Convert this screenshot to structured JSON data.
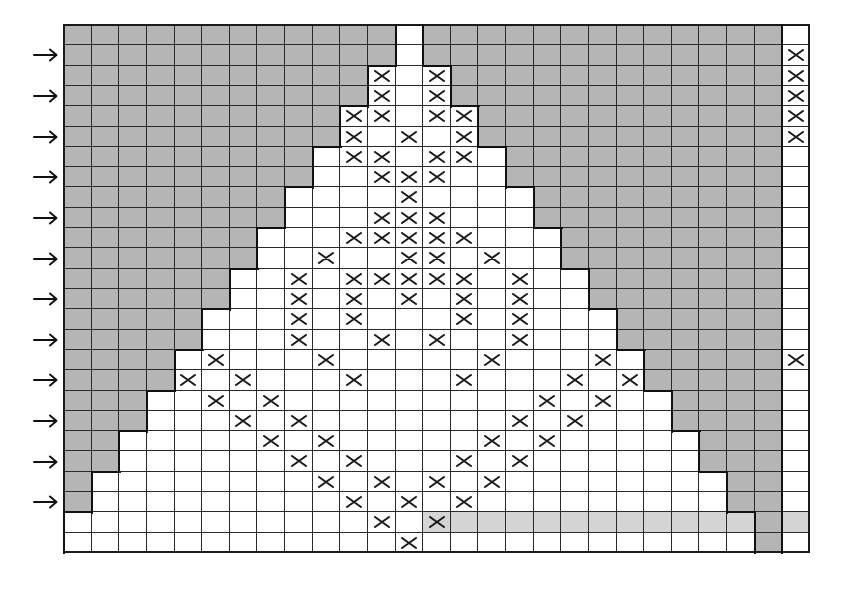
{
  "chart_info": {
    "type": "knitting-pattern-grid",
    "rows": 26,
    "cols": 27,
    "center_col": 12,
    "motif_cols": [
      0,
      24
    ],
    "separator_col": 25,
    "side_col": 26
  },
  "colors": {
    "background_cell": "#b5b5b5",
    "pattern_cell": "#ffffff",
    "highlight_row_cell": "#d4d4d4",
    "grid_line": "#2a2a2a",
    "mark": "#1a1a1a"
  },
  "legend": {
    "mark_symbol": "X",
    "row_marker_symbol": "→"
  },
  "row_markers": [
    1,
    3,
    5,
    7,
    9,
    11,
    13,
    15,
    17,
    19,
    21,
    23
  ],
  "highlighted_row": {
    "row": 24,
    "from_col": 13,
    "to_col": 24,
    "also_cols": [
      26
    ]
  },
  "marks": [
    {
      "row": 1,
      "cols": [
        26
      ]
    },
    {
      "row": 2,
      "cols": [
        11,
        13,
        26
      ]
    },
    {
      "row": 3,
      "cols": [
        11,
        13,
        26
      ]
    },
    {
      "row": 4,
      "cols": [
        10,
        11,
        13,
        14,
        26
      ]
    },
    {
      "row": 5,
      "cols": [
        10,
        12,
        14,
        26
      ]
    },
    {
      "row": 6,
      "cols": [
        10,
        11,
        13,
        14
      ]
    },
    {
      "row": 7,
      "cols": [
        11,
        12,
        13
      ]
    },
    {
      "row": 8,
      "cols": [
        12
      ]
    },
    {
      "row": 9,
      "cols": [
        11,
        12,
        13
      ]
    },
    {
      "row": 10,
      "cols": [
        10,
        11,
        12,
        13,
        14
      ]
    },
    {
      "row": 11,
      "cols": [
        9,
        12,
        13,
        15
      ]
    },
    {
      "row": 12,
      "cols": [
        8,
        10,
        11,
        12,
        13,
        14,
        16
      ]
    },
    {
      "row": 13,
      "cols": [
        8,
        10,
        12,
        14,
        16
      ]
    },
    {
      "row": 14,
      "cols": [
        8,
        10,
        14,
        16
      ]
    },
    {
      "row": 15,
      "cols": [
        8,
        11,
        13,
        16
      ]
    },
    {
      "row": 16,
      "cols": [
        5,
        9,
        15,
        19,
        26
      ]
    },
    {
      "row": 17,
      "cols": [
        4,
        6,
        10,
        14,
        18,
        20
      ]
    },
    {
      "row": 18,
      "cols": [
        5,
        7,
        17,
        19
      ]
    },
    {
      "row": 19,
      "cols": [
        6,
        8,
        16,
        18
      ]
    },
    {
      "row": 20,
      "cols": [
        7,
        9,
        15,
        17
      ]
    },
    {
      "row": 21,
      "cols": [
        8,
        10,
        14,
        16
      ]
    },
    {
      "row": 22,
      "cols": [
        9,
        11,
        13,
        15
      ]
    },
    {
      "row": 23,
      "cols": [
        10,
        12,
        14
      ]
    },
    {
      "row": 24,
      "cols": [
        11,
        13
      ]
    },
    {
      "row": 25,
      "cols": [
        12
      ]
    }
  ]
}
